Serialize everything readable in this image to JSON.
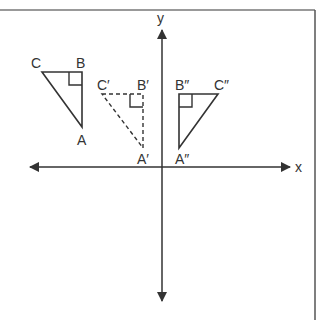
{
  "colors": {
    "line": "#333333",
    "frame": "#555555",
    "background": "#ffffff"
  },
  "axes": {
    "x_label": "x",
    "y_label": "y"
  },
  "triangles": [
    {
      "name": "ABC",
      "style": "solid",
      "vertices": {
        "A": {
          "label": "A",
          "x": 82,
          "y": 127
        },
        "B": {
          "label": "B",
          "x": 82,
          "y": 72
        },
        "C": {
          "label": "C",
          "x": 42,
          "y": 72
        }
      },
      "right_angle_at": "B"
    },
    {
      "name": "A'B'C'",
      "style": "dashed",
      "vertices": {
        "A": {
          "label": "A′",
          "x": 143,
          "y": 148
        },
        "B": {
          "label": "B′",
          "x": 143,
          "y": 94
        },
        "C": {
          "label": "C′",
          "x": 102,
          "y": 94
        }
      },
      "right_angle_at": "B"
    },
    {
      "name": "A''B''C''",
      "style": "solid",
      "vertices": {
        "A": {
          "label": "A″",
          "x": 179,
          "y": 148
        },
        "B": {
          "label": "B″",
          "x": 179,
          "y": 94
        },
        "C": {
          "label": "C″",
          "x": 218,
          "y": 94
        }
      },
      "right_angle_at": "B"
    }
  ]
}
